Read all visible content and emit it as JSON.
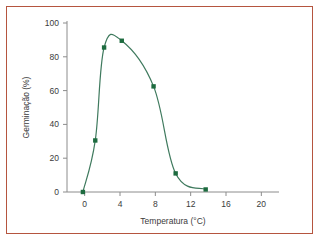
{
  "figure": {
    "border_color": "#b5553f",
    "background_color": "#ffffff"
  },
  "chart_data": {
    "type": "line",
    "title": "",
    "subtitle": "",
    "xlabel": "Temperatura (°C)",
    "ylabel": "Germinação (%)",
    "xlim": [
      -2,
      22
    ],
    "ylim": [
      0,
      100
    ],
    "xticks": [
      0,
      4,
      8,
      12,
      16,
      20
    ],
    "xtick_labels": [
      "0",
      "4",
      "8",
      "12",
      "16",
      "20"
    ],
    "yticks": [
      0,
      20,
      40,
      60,
      80,
      100
    ],
    "ytick_labels": [
      "0",
      "20",
      "40",
      "60",
      "80",
      "100"
    ],
    "grid": false,
    "legend": null,
    "series": [
      {
        "name": "Germinação",
        "line_color": "#3f7a5e",
        "marker_color": "#1d6b3f",
        "marker": "square",
        "x": [
          -0.2,
          1.2,
          2.2,
          4.2,
          7.8,
          10.3,
          13.7
        ],
        "y": [
          0,
          30.5,
          85.5,
          89.5,
          62.5,
          11,
          1.5
        ]
      }
    ],
    "annotations": []
  }
}
